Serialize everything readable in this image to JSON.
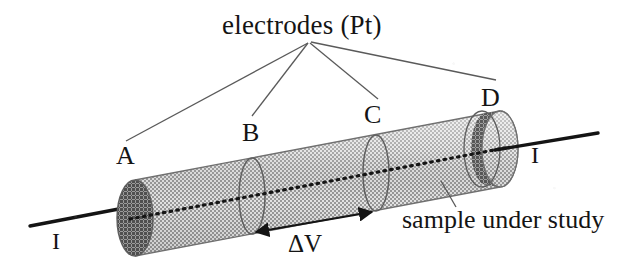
{
  "figure": {
    "title_label": "electrodes (Pt)",
    "sample_label": "sample under study",
    "voltage_label": "ΔV",
    "electrodes": [
      {
        "id": "A",
        "label": "A"
      },
      {
        "id": "B",
        "label": "B"
      },
      {
        "id": "C",
        "label": "C"
      },
      {
        "id": "D",
        "label": "D"
      }
    ],
    "current_terminals": [
      {
        "id": "left",
        "label": "I"
      },
      {
        "id": "right",
        "label": "I"
      }
    ],
    "colors": {
      "ink": "#141414",
      "leader_line": "#5a5a5a",
      "cylinder_body": "#b4b4b4",
      "cylinder_body_highlight": "#d2d2d2",
      "end_cap_dark": "#737373",
      "outline": "#6e6e6e",
      "background": "#ffffff"
    },
    "geometry": {
      "cylinder_left_center": [
        135,
        218
      ],
      "cylinder_right_center": [
        500,
        149
      ],
      "cylinder_radius_y": 38,
      "cylinder_radius_x": 18,
      "electrode_b_center": [
        252,
        196
      ],
      "electrode_c_center": [
        376,
        173
      ],
      "leader_origin": [
        308,
        43
      ],
      "current_lead_left_end": [
        30,
        225
      ],
      "current_lead_right_end": [
        598,
        134
      ]
    }
  }
}
